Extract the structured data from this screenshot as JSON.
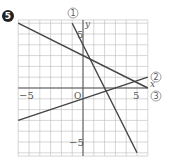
{
  "problem_number": "5",
  "chart_data": {
    "type": "line",
    "title": "",
    "xlabel": "x",
    "ylabel": "y",
    "origin_label": "O",
    "xlim": [
      -6,
      6
    ],
    "ylim": [
      -6.3,
      6.3
    ],
    "grid": true,
    "tick_labels": {
      "x": [
        {
          "value": -5,
          "label": "−5"
        },
        {
          "value": 5,
          "label": "5"
        }
      ],
      "y": [
        {
          "value": 5,
          "label": "5"
        },
        {
          "value": -5,
          "label": "−5"
        }
      ]
    },
    "series": [
      {
        "name": "①",
        "equation": "y = -2x + 4",
        "slope": -2,
        "intercept": 4,
        "points": [
          [
            -1,
            6
          ],
          [
            5,
            -6
          ]
        ]
      },
      {
        "name": "②",
        "equation": "y = x/3 - 1",
        "slope": 0.3333,
        "intercept": -1,
        "points": [
          [
            -6,
            -3
          ],
          [
            6,
            1
          ]
        ]
      },
      {
        "name": "③",
        "equation": "y = -x/2 + 3",
        "slope": -0.5,
        "intercept": 3,
        "points": [
          [
            -6,
            6
          ],
          [
            6,
            0
          ]
        ]
      }
    ],
    "line_color": "#444444",
    "grid_color": "#bbbbbb",
    "axis_color": "#555555"
  }
}
